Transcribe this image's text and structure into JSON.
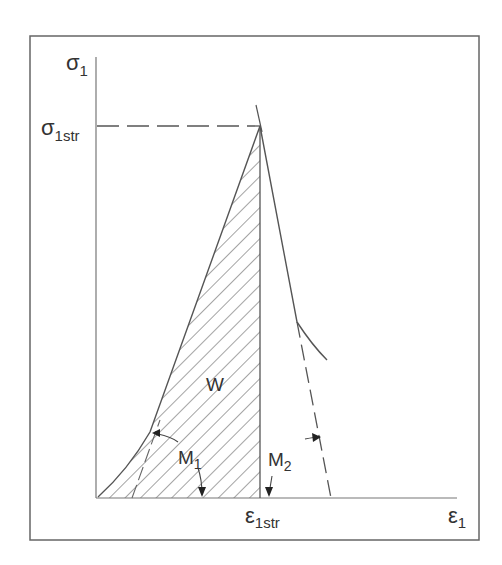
{
  "diagram": {
    "title": "",
    "type": "stress-strain curve",
    "colors": {
      "line": "#555555",
      "hatch": "#666666",
      "frame": "#666666",
      "text": "#333333"
    },
    "labels": {
      "y_axis": {
        "base": "σ",
        "sub": "1"
      },
      "y_peak": {
        "base": "σ",
        "sub": "1str"
      },
      "x_axis": {
        "base": "ε",
        "sub": "1"
      },
      "x_peak": {
        "base": "ε",
        "sub": "1str"
      },
      "area": "W",
      "modulus_loading": {
        "base": "M",
        "sub": "1"
      },
      "modulus_unloading": {
        "base": "M",
        "sub": "2"
      }
    },
    "annotations": [
      "Hatched area W under loading curve up to peak strain",
      "Dashed horizontal line from σ1str to peak",
      "Dashed tangent lines for M1 (loading) and M2 (post-peak unloading)"
    ]
  }
}
